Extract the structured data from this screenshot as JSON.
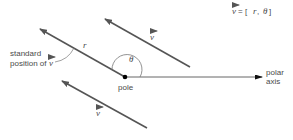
{
  "diagram": {
    "title_formula": {
      "vector": "v",
      "equals": "= [",
      "r": "r",
      "comma": ", ",
      "theta": "θ",
      "close": "]"
    },
    "labels": {
      "standard_line1": "standard",
      "standard_line2": "position of",
      "standard_vec": "v",
      "r": "r",
      "theta": "θ",
      "pole": "pole",
      "polar_line1": "polar",
      "polar_line2": "axis",
      "vector_upper": "v",
      "vector_lower": "v"
    },
    "colors": {
      "line": "#555555",
      "text": "#4a4a4a",
      "pole": "#000000"
    }
  }
}
